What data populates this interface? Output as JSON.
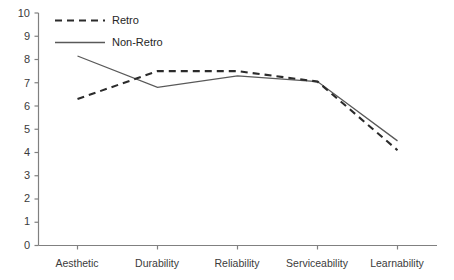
{
  "chart_data": {
    "type": "line",
    "title": "",
    "subtitle": "",
    "xlabel": "",
    "ylabel": "",
    "categories": [
      "Aesthetic",
      "Durability",
      "Reliability",
      "Serviceability",
      "Learnability"
    ],
    "series": [
      {
        "name": "Retro",
        "style": "dashed",
        "color": "#2b2b2b",
        "values": [
          6.3,
          7.5,
          7.5,
          7.05,
          4.1
        ]
      },
      {
        "name": "Non-Retro",
        "style": "solid",
        "color": "#595959",
        "values": [
          8.15,
          6.8,
          7.3,
          7.05,
          4.5
        ]
      }
    ],
    "ylim": [
      0,
      10
    ],
    "ytick_values": [
      0,
      1,
      2,
      3,
      4,
      5,
      6,
      7,
      8,
      9,
      10
    ],
    "ytick_labels": [
      "0",
      "1",
      "2",
      "3",
      "4",
      "5",
      "6",
      "7",
      "8",
      "9",
      "10"
    ],
    "grid": false,
    "legend_position": "top-left",
    "legend_entries": [
      "Retro",
      "Non-Retro"
    ],
    "axis_color": "#808080"
  },
  "legend": {
    "items": [
      {
        "label": "Retro"
      },
      {
        "label": "Non-Retro"
      }
    ]
  },
  "y_axis": {
    "labels": [
      "10",
      "9",
      "8",
      "7",
      "6",
      "5",
      "4",
      "3",
      "2",
      "1",
      "0"
    ]
  },
  "x_axis": {
    "labels": [
      "Aesthetic",
      "Durability",
      "Reliability",
      "Serviceability",
      "Learnability"
    ]
  }
}
